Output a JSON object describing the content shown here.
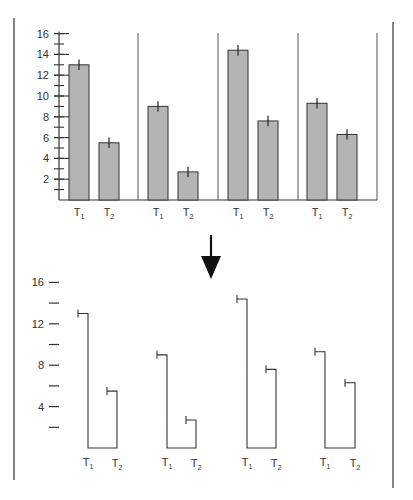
{
  "chart_data": [
    {
      "type": "bar",
      "title": "",
      "xlabel": "",
      "ylabel": "",
      "ylim": [
        0,
        16
      ],
      "yticks": [
        2,
        4,
        6,
        8,
        10,
        12,
        14,
        16
      ],
      "ytick_labels": [
        "2",
        "4",
        "6",
        "8",
        "10",
        "12",
        "14",
        "16"
      ],
      "grid": false,
      "groups": [
        {
          "categories": [
            "T1",
            "T2"
          ],
          "values": [
            13.0,
            5.5
          ],
          "errors": [
            0.5,
            0.5
          ]
        },
        {
          "categories": [
            "T1",
            "T2"
          ],
          "values": [
            9.0,
            2.7
          ],
          "errors": [
            0.5,
            0.5
          ]
        },
        {
          "categories": [
            "T1",
            "T2"
          ],
          "values": [
            14.4,
            7.6
          ],
          "errors": [
            0.5,
            0.5
          ]
        },
        {
          "categories": [
            "T1",
            "T2"
          ],
          "values": [
            9.3,
            6.3
          ],
          "errors": [
            0.5,
            0.5
          ]
        }
      ],
      "bar_color": "#b4b4b4"
    },
    {
      "type": "bracket",
      "title": "",
      "ylim": [
        0,
        16
      ],
      "ytick_labels": [
        "16",
        "12",
        "8",
        "4"
      ],
      "minor_ticks": [
        14,
        10,
        6,
        2
      ],
      "grid": false,
      "groups": [
        {
          "categories": [
            "T1",
            "T2"
          ],
          "values": [
            13.0,
            5.5
          ]
        },
        {
          "categories": [
            "T1",
            "T2"
          ],
          "values": [
            9.0,
            2.7
          ]
        },
        {
          "categories": [
            "T1",
            "T2"
          ],
          "values": [
            14.4,
            7.6
          ]
        },
        {
          "categories": [
            "T1",
            "T2"
          ],
          "values": [
            9.3,
            6.3
          ]
        }
      ]
    }
  ],
  "labels": {
    "t1": "T",
    "t1_sub": "1",
    "t2": "T",
    "t2_sub": "2",
    "arrow": "down-arrow"
  }
}
